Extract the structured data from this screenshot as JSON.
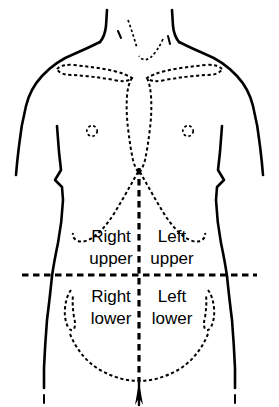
{
  "figure": {
    "colors": {
      "ink": "#000000",
      "background": "#ffffff"
    }
  },
  "quadrants": [
    {
      "id": "right-upper",
      "line1": "Right",
      "line2": "upper",
      "position": "upper-left-of-image",
      "label_x": 111,
      "label_y1": 242,
      "label_y2": 264
    },
    {
      "id": "left-upper",
      "line1": "Left",
      "line2": "upper",
      "position": "upper-right-of-image",
      "label_x": 172,
      "label_y1": 242,
      "label_y2": 264
    },
    {
      "id": "right-lower",
      "line1": "Right",
      "line2": "lower",
      "position": "lower-left-of-image",
      "label_x": 111,
      "label_y1": 302,
      "label_y2": 324
    },
    {
      "id": "left-lower",
      "line1": "Left",
      "line2": "lower",
      "position": "lower-right-of-image",
      "label_x": 172,
      "label_y1": 302,
      "label_y2": 324
    }
  ],
  "dividers": {
    "vertical_midline_x": 139,
    "horizontal_umbilical_y": 275
  },
  "landmarks": [
    {
      "id": "clavicle-right",
      "label": "clavicle"
    },
    {
      "id": "clavicle-left",
      "label": "clavicle"
    },
    {
      "id": "sternum",
      "label": "sternum"
    },
    {
      "id": "costal-margin-right",
      "label": "costal margin"
    },
    {
      "id": "costal-margin-left",
      "label": "costal margin"
    },
    {
      "id": "nipple-right",
      "label": "nipple"
    },
    {
      "id": "nipple-left",
      "label": "nipple"
    },
    {
      "id": "iliac-crest-right",
      "label": "iliac crest"
    },
    {
      "id": "iliac-crest-left",
      "label": "iliac crest"
    },
    {
      "id": "inguinal-curve",
      "label": "inguinal ligament line"
    },
    {
      "id": "suprasternal-notch",
      "label": "suprasternal notch"
    }
  ]
}
